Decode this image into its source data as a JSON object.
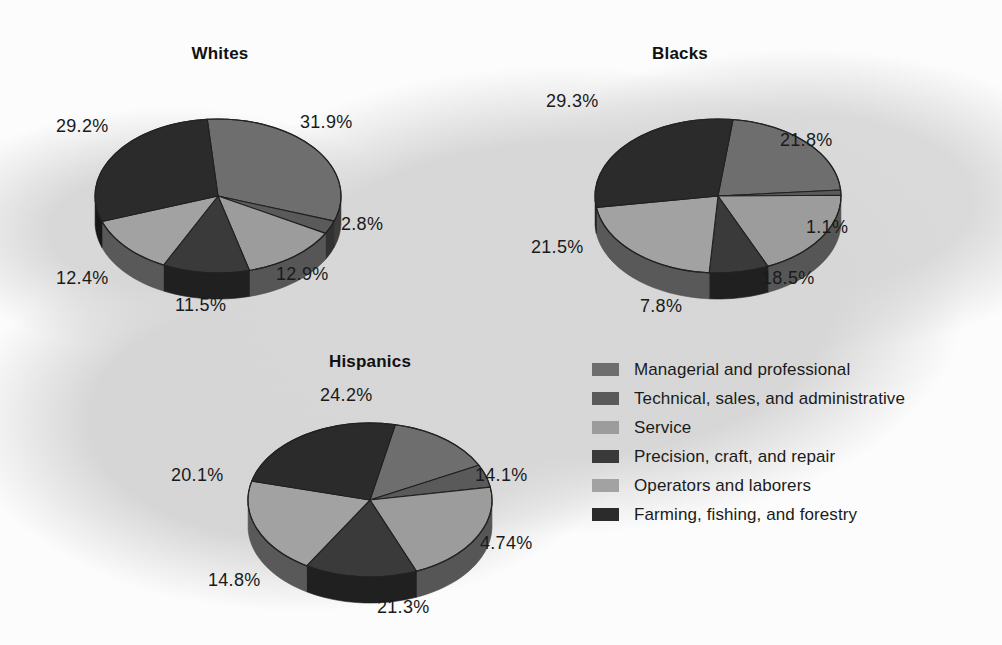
{
  "chart_data": {
    "type": "pie",
    "title": "",
    "legend_position": "bottom-right",
    "unit": "percent",
    "categories": [
      "Managerial and professional",
      "Technical, sales, and administrative",
      "Service",
      "Precision, craft, and repair",
      "Operators and laborers",
      "Farming, fishing, and forestry"
    ],
    "colors": [
      "#6e6e6e",
      "#5a5a5a",
      "#9c9c9c",
      "#3a3a3a",
      "#a2a2a2",
      "#2b2b2b"
    ],
    "series": [
      {
        "name": "Whites",
        "values": [
          31.9,
          2.8,
          12.9,
          11.5,
          12.4,
          29.2
        ],
        "labels": [
          "31.9%",
          "2.8%",
          "12.9%",
          "11.5%",
          "12.4%",
          "29.2%"
        ]
      },
      {
        "name": "Blacks",
        "values": [
          21.8,
          1.1,
          18.5,
          7.8,
          21.5,
          29.3
        ],
        "labels": [
          "21.8%",
          "1.1%",
          "18.5%",
          "7.8%",
          "21.5%",
          "29.3%"
        ]
      },
      {
        "name": "Hispanics",
        "values": [
          14.1,
          4.74,
          21.3,
          14.8,
          20.1,
          24.2
        ],
        "labels": [
          "14.1%",
          "4.74%",
          "21.3%",
          "14.8%",
          "20.1%",
          "24.2%"
        ]
      }
    ]
  },
  "charts": {
    "whites": {
      "title": "Whites",
      "labels": {
        "l1": "31.9%",
        "l2": "2.8%",
        "l3": "12.9%",
        "l4": "11.5%",
        "l5": "12.4%",
        "l6": "29.2%"
      }
    },
    "blacks": {
      "title": "Blacks",
      "labels": {
        "l1": "21.8%",
        "l2": "1.1%",
        "l3": "18.5%",
        "l4": "7.8%",
        "l5": "21.5%",
        "l6": "29.3%"
      }
    },
    "hispanics": {
      "title": "Hispanics",
      "labels": {
        "l1": "14.1%",
        "l2": "4.74%",
        "l3": "21.3%",
        "l4": "14.8%",
        "l5": "20.1%",
        "l6": "24.2%"
      }
    }
  },
  "legend": {
    "items": [
      {
        "label": "Managerial and professional",
        "color": "#6e6e6e",
        "swatch_name": "legend-swatch-managerial"
      },
      {
        "label": "Technical, sales, and administrative",
        "color": "#5a5a5a",
        "swatch_name": "legend-swatch-technical"
      },
      {
        "label": "Service",
        "color": "#9c9c9c",
        "swatch_name": "legend-swatch-service"
      },
      {
        "label": "Precision, craft, and repair",
        "color": "#3a3a3a",
        "swatch_name": "legend-swatch-precision"
      },
      {
        "label": "Operators and laborers",
        "color": "#a2a2a2",
        "swatch_name": "legend-swatch-operators"
      },
      {
        "label": "Farming, fishing, and forestry",
        "color": "#2b2b2b",
        "swatch_name": "legend-swatch-farming"
      }
    ]
  }
}
